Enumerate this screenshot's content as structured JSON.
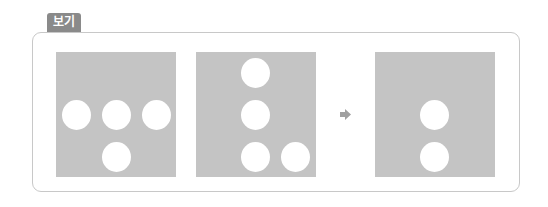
{
  "label": {
    "text": "보기"
  },
  "colors": {
    "label_bg": "#8a8a8a",
    "panel_bg": "#c4c4c4",
    "dot": "#ffffff",
    "frame": "#c8c8c8",
    "arrow": "#a0a0a0"
  },
  "panels": [
    {
      "name": "panel-1",
      "dot_count": 4
    },
    {
      "name": "panel-2",
      "dot_count": 4
    },
    {
      "name": "panel-3-result",
      "dot_count": 2
    }
  ],
  "arrow": {
    "icon": "arrow-right-icon"
  }
}
